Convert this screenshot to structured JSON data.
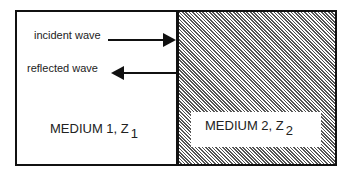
{
  "diagram": {
    "incident_label": "incident wave",
    "reflected_label": "reflected wave",
    "medium1": {
      "text": "MEDIUM 1, Z",
      "subscript": "1"
    },
    "medium2": {
      "text": "MEDIUM 2, Z",
      "subscript": "2"
    },
    "colors": {
      "line": "#111111",
      "hatch": "#555555",
      "background": "#ffffff"
    }
  }
}
